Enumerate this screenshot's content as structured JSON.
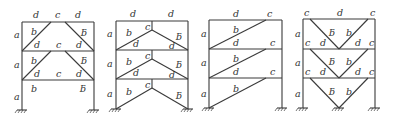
{
  "figure": {
    "label_legend": [
      "a",
      "b",
      "c",
      "d"
    ],
    "frames": [
      {
        "id": "frame-1",
        "type": "inverted-V (chevron) braces, knee-style",
        "labels": {
          "columns": [
            "a",
            "a",
            "a"
          ],
          "beam_top": [
            "d",
            "c",
            "d"
          ],
          "beam_mid": [
            "d",
            "c",
            "d"
          ],
          "beam_low": [
            "d",
            "c",
            "d"
          ],
          "braces": [
            "b",
            "ƃ"
          ]
        }
      },
      {
        "id": "frame-2",
        "type": "V-shaped (inverted chevron) braces meeting at beam midspan with vertical link",
        "labels": {
          "columns": [
            "a",
            "a",
            "a"
          ],
          "beams": [
            "d",
            "d"
          ],
          "link": "c",
          "braces": [
            "b",
            "ƃ"
          ]
        }
      },
      {
        "id": "frame-3",
        "type": "single diagonal eccentric brace",
        "labels": {
          "columns": [
            "a",
            "a",
            "a"
          ],
          "beam": "d",
          "link": "c",
          "brace": "b"
        }
      },
      {
        "id": "frame-4",
        "type": "V braces with end links",
        "labels": {
          "columns": [
            "a",
            "a",
            "a"
          ],
          "beams": [
            "d",
            "d"
          ],
          "links": [
            "c",
            "c"
          ],
          "braces": [
            "ƃ",
            "b"
          ]
        }
      }
    ]
  }
}
